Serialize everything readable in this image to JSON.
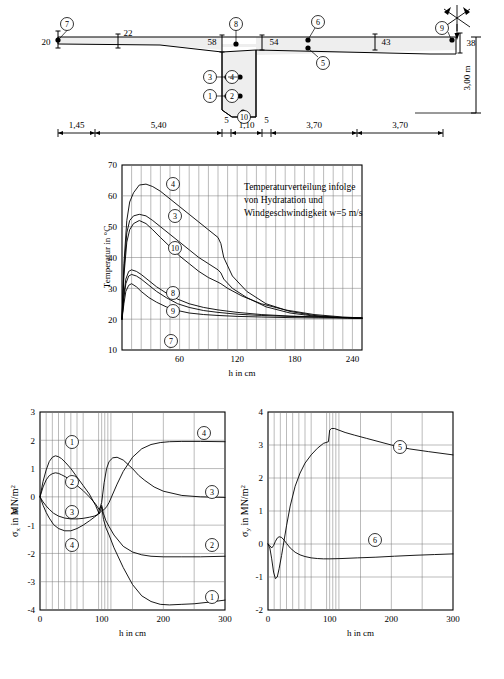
{
  "figure": {
    "cross_section": {
      "name": "bridge-cross-section",
      "thickness_labels": [
        {
          "id": "t-left-edge",
          "value": "20"
        },
        {
          "id": "t-22",
          "value": "22"
        },
        {
          "id": "t-58",
          "value": "58"
        },
        {
          "id": "t-54",
          "value": "54"
        },
        {
          "id": "t-43",
          "value": "43"
        },
        {
          "id": "t-38",
          "value": "38"
        }
      ],
      "height_label": "3,00 m",
      "dimensions": [
        "1,45",
        "5,40",
        "5",
        "1,10",
        "5",
        "3,70",
        "3,70"
      ],
      "point_markers": [
        "1",
        "2",
        "3",
        "4",
        "5",
        "6",
        "7",
        "8",
        "9",
        "10"
      ],
      "wind_symbol": "wind-rose-icon"
    },
    "temperature_chart": {
      "annotation_lines": [
        "Temperaturverteilung infolge",
        "von Hydratation und",
        "Windgeschwindigkeit w=5 m/s"
      ],
      "curve_labels": [
        "4",
        "3",
        "10",
        "8",
        "9",
        "7"
      ]
    },
    "sigma_x_chart": {
      "curve_labels": [
        "1",
        "2",
        "3",
        "4"
      ]
    },
    "sigma_y_chart": {
      "curve_labels": [
        "5",
        "6"
      ]
    }
  },
  "chart_data": [
    {
      "type": "line",
      "name": "temperature-distribution",
      "title": "Temperaturverteilung infolge von Hydratation und Windgeschwindigkeit w=5 m/s",
      "xlabel": "h in cm",
      "ylabel": "Temperatur in °C",
      "xlim": [
        0,
        250
      ],
      "ylim": [
        10,
        70
      ],
      "xticks": [
        60,
        120,
        180,
        240
      ],
      "yticks": [
        10,
        20,
        30,
        40,
        50,
        60,
        70
      ],
      "grid": true,
      "legend": "inline-curve-numbers",
      "series": [
        {
          "name": "4",
          "x": [
            0,
            2,
            5,
            8,
            12,
            18,
            25,
            32,
            40,
            50,
            60,
            70,
            80,
            90,
            100,
            103,
            106,
            115,
            130,
            150,
            175,
            200,
            225,
            250
          ],
          "y": [
            20,
            38,
            52,
            58,
            61,
            63.5,
            63.8,
            63,
            61.5,
            59,
            56.5,
            54,
            51.5,
            49,
            46.5,
            44.5,
            40,
            34,
            29,
            25,
            22.5,
            21.2,
            20.6,
            20.3
          ]
        },
        {
          "name": "3",
          "x": [
            0,
            2,
            5,
            8,
            12,
            18,
            25,
            32,
            40,
            50,
            60,
            70,
            80,
            90,
            100,
            103,
            106,
            115,
            130,
            150,
            175,
            200,
            225,
            250
          ],
          "y": [
            20,
            36,
            48,
            52,
            53.5,
            54,
            53.5,
            52,
            50,
            47.5,
            45,
            42.5,
            40,
            38,
            36,
            35,
            33,
            30,
            27,
            24,
            22,
            21,
            20.5,
            20.3
          ]
        },
        {
          "name": "10",
          "x": [
            0,
            2,
            5,
            8,
            12,
            18,
            25,
            32,
            40,
            50,
            60,
            70,
            80,
            90,
            100,
            103,
            110,
            125,
            145,
            170,
            200,
            230,
            250
          ],
          "y": [
            20,
            34,
            45,
            49,
            51,
            52,
            51,
            49,
            46.5,
            43.5,
            40.5,
            38,
            35.5,
            33.5,
            32,
            31.5,
            30,
            27.5,
            25,
            23,
            21.5,
            20.7,
            20.4
          ]
        },
        {
          "name": "8",
          "x": [
            0,
            2,
            4,
            7,
            10,
            15,
            20,
            28,
            36,
            46,
            58,
            70,
            85,
            100,
            120,
            145,
            175,
            205,
            235,
            250
          ],
          "y": [
            20,
            28,
            33,
            35.5,
            36,
            35.5,
            34.5,
            32.5,
            30.5,
            28.5,
            26.5,
            25,
            23.8,
            23,
            22.2,
            21.5,
            21,
            20.7,
            20.5,
            20.4
          ]
        },
        {
          "name": "9",
          "x": [
            0,
            2,
            4,
            7,
            10,
            15,
            20,
            28,
            36,
            46,
            58,
            70,
            85,
            100,
            120,
            145,
            175,
            205,
            235,
            250
          ],
          "y": [
            20,
            27,
            31.5,
            34,
            34.5,
            34,
            33,
            31,
            29,
            27,
            25,
            23.8,
            22.8,
            22.2,
            21.6,
            21.2,
            20.9,
            20.7,
            20.5,
            20.4
          ]
        },
        {
          "name": "7",
          "x": [
            0,
            2,
            4,
            7,
            10,
            15,
            20,
            28,
            36,
            46,
            58,
            70,
            85,
            100,
            120,
            145,
            175,
            205,
            235,
            250
          ],
          "y": [
            20,
            25,
            29,
            31,
            31.5,
            30.5,
            29,
            27,
            25.5,
            24,
            22.8,
            22,
            21.5,
            21.2,
            20.9,
            20.7,
            20.5,
            20.4,
            20.3,
            20.2
          ]
        }
      ]
    },
    {
      "type": "line",
      "name": "sigma-x-distribution",
      "title": "",
      "xlabel": "h in cm",
      "ylabel": "σx in MN/m2",
      "xlim": [
        0,
        300
      ],
      "ylim": [
        -4,
        3
      ],
      "xticks": [
        0,
        100,
        200,
        300
      ],
      "yticks": [
        -4,
        -3,
        -2,
        -1,
        0,
        1,
        2,
        3
      ],
      "grid": true,
      "series": [
        {
          "name": "1",
          "x": [
            0,
            5,
            10,
            15,
            20,
            25,
            30,
            35,
            42,
            50,
            60,
            70,
            80,
            90,
            96,
            100,
            103,
            107,
            112,
            120,
            135,
            150,
            165,
            180,
            195,
            210,
            230,
            250,
            275,
            300
          ],
          "y": [
            0,
            0.55,
            0.95,
            1.25,
            1.4,
            1.45,
            1.42,
            1.35,
            1.2,
            1.0,
            0.7,
            0.4,
            0.1,
            -0.3,
            -0.6,
            -0.35,
            -0.8,
            -1.1,
            -1.35,
            -1.8,
            -2.5,
            -3.1,
            -3.5,
            -3.7,
            -3.8,
            -3.82,
            -3.8,
            -3.78,
            -3.72,
            -3.65
          ]
        },
        {
          "name": "2",
          "x": [
            0,
            5,
            10,
            15,
            20,
            25,
            30,
            35,
            42,
            50,
            60,
            70,
            80,
            90,
            96,
            100,
            103,
            107,
            112,
            120,
            135,
            150,
            165,
            180,
            200,
            230,
            260,
            300
          ],
          "y": [
            0,
            0.35,
            0.6,
            0.75,
            0.82,
            0.85,
            0.83,
            0.78,
            0.7,
            0.58,
            0.4,
            0.22,
            0.0,
            -0.25,
            -0.45,
            -0.3,
            -0.6,
            -0.85,
            -1.05,
            -1.35,
            -1.75,
            -1.95,
            -2.05,
            -2.1,
            -2.12,
            -2.12,
            -2.12,
            -2.1
          ]
        },
        {
          "name": "3",
          "x": [
            0,
            5,
            10,
            15,
            22,
            30,
            40,
            50,
            60,
            70,
            80,
            88,
            94,
            100,
            104,
            108,
            112,
            118,
            125,
            135,
            145,
            150,
            155,
            160,
            170,
            185,
            200,
            230,
            260,
            300
          ],
          "y": [
            0,
            -0.18,
            -0.32,
            -0.44,
            -0.58,
            -0.68,
            -0.75,
            -0.78,
            -0.78,
            -0.76,
            -0.72,
            -0.68,
            -0.62,
            -0.2,
            0.5,
            1.0,
            1.25,
            1.38,
            1.4,
            1.3,
            1.1,
            1.0,
            0.88,
            0.76,
            0.58,
            0.35,
            0.2,
            0.05,
            0.0,
            -0.02
          ]
        },
        {
          "name": "4",
          "x": [
            0,
            5,
            10,
            15,
            22,
            30,
            40,
            50,
            60,
            70,
            80,
            88,
            94,
            100,
            104,
            108,
            112,
            118,
            125,
            135,
            150,
            165,
            180,
            195,
            210,
            230,
            260,
            300
          ],
          "y": [
            0,
            -0.3,
            -0.55,
            -0.75,
            -0.98,
            -1.12,
            -1.2,
            -1.2,
            -1.12,
            -1.0,
            -0.85,
            -0.72,
            -0.62,
            -0.5,
            -0.45,
            -0.35,
            -0.2,
            0.1,
            0.45,
            0.9,
            1.4,
            1.7,
            1.85,
            1.92,
            1.95,
            1.96,
            1.96,
            1.95
          ]
        }
      ]
    },
    {
      "type": "line",
      "name": "sigma-y-distribution",
      "title": "",
      "xlabel": "h in cm",
      "ylabel": "σy in MN/m2",
      "xlim": [
        0,
        300
      ],
      "ylim": [
        -2,
        4
      ],
      "xticks": [
        0,
        100,
        200,
        300
      ],
      "yticks": [
        -2,
        -1,
        0,
        1,
        2,
        3,
        4
      ],
      "grid": true,
      "series": [
        {
          "name": "5",
          "x": [
            0,
            3,
            6,
            9,
            12,
            15,
            18,
            22,
            26,
            30,
            36,
            44,
            52,
            60,
            70,
            80,
            90,
            98,
            100,
            103,
            108,
            115,
            125,
            140,
            160,
            180,
            200,
            230,
            260,
            300
          ],
          "y": [
            0,
            -0.12,
            -0.45,
            -0.85,
            -1.05,
            -1.0,
            -0.75,
            -0.35,
            0.1,
            0.55,
            1.15,
            1.75,
            2.15,
            2.45,
            2.7,
            2.9,
            3.05,
            3.1,
            3.45,
            3.5,
            3.5,
            3.45,
            3.38,
            3.3,
            3.2,
            3.1,
            3.0,
            2.88,
            2.8,
            2.7
          ]
        },
        {
          "name": "6",
          "x": [
            0,
            3,
            6,
            9,
            12,
            15,
            18,
            22,
            26,
            30,
            36,
            44,
            52,
            60,
            70,
            80,
            90,
            100,
            120,
            145,
            175,
            205,
            240,
            270,
            300
          ],
          "y": [
            0,
            -0.05,
            -0.12,
            -0.05,
            0.08,
            0.18,
            0.22,
            0.2,
            0.12,
            0.02,
            -0.12,
            -0.25,
            -0.33,
            -0.38,
            -0.42,
            -0.44,
            -0.45,
            -0.45,
            -0.44,
            -0.42,
            -0.4,
            -0.37,
            -0.34,
            -0.32,
            -0.3
          ]
        }
      ]
    }
  ],
  "labels": {
    "h_in_cm": "h in cm",
    "temp_axis": "Temperatur in °C",
    "sigma_x_axis": "σ",
    "sigma_x_sub": "x",
    "sigma_y_sub": "y",
    "mn_unit": " in MN/m",
    "sup2": "2"
  }
}
